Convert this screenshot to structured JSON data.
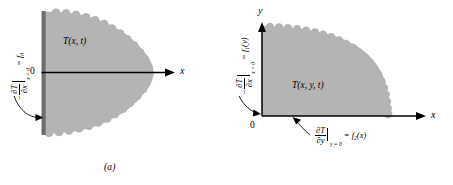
{
  "figure": {
    "type": "technical-diagram",
    "background_color": "#ffffff",
    "region_fill_color": "#b4b4b4",
    "line_color": "#000000",
    "wall_color": "#6e6e6e"
  },
  "panels": [
    {
      "id": "a",
      "caption": "(a)",
      "region_label": "T(x, t)",
      "axes": [
        {
          "name": "x-axis",
          "label": "x",
          "origin_label": "0"
        }
      ],
      "boundary_condition": {
        "sign": "−",
        "numerator": "∂T",
        "denominator": "∂x",
        "evaluated_at": "x = 0",
        "equals": "= f",
        "equals_subscript": "0",
        "full_text": "−∂T/∂x |x=0 = f0"
      }
    },
    {
      "id": "b",
      "caption": "(b)",
      "region_label": "T(x, y, t)",
      "axes": [
        {
          "name": "x-axis",
          "label": "x",
          "origin_label": "0"
        },
        {
          "name": "y-axis",
          "label": "y",
          "origin_label": "0"
        }
      ],
      "boundary_conditions": [
        {
          "name": "left-boundary-condition",
          "sign": "−",
          "numerator": "∂T",
          "denominator": "∂x",
          "evaluated_at": "x = 0",
          "equals": "= f",
          "equals_subscript": "1",
          "equals_argument": "(y)",
          "full_text": "−∂T/∂x |x=0 = f1(y)"
        },
        {
          "name": "bottom-boundary-condition",
          "sign": "",
          "numerator": "∂T",
          "denominator": "∂y",
          "evaluated_at": "y = 0",
          "equals": "= f",
          "equals_subscript": "2",
          "equals_argument": "(x)",
          "full_text": "∂T/∂y |y=0 = f2(x)"
        }
      ]
    }
  ]
}
